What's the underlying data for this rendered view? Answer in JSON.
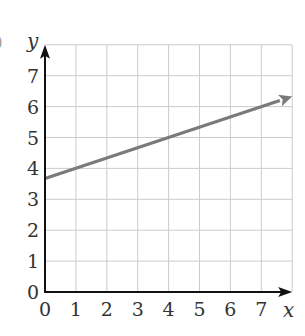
{
  "chart_data": {
    "type": "line",
    "title": "",
    "xlabel": "x",
    "ylabel": "y",
    "xlim": [
      0,
      8
    ],
    "ylim": [
      0,
      8
    ],
    "x_ticks": [
      "0",
      "1",
      "2",
      "3",
      "4",
      "5",
      "6",
      "7"
    ],
    "y_ticks": [
      "0",
      "1",
      "2",
      "3",
      "4",
      "5",
      "6",
      "7"
    ],
    "grid": true,
    "legend": null,
    "series": [
      {
        "name": "line",
        "equation": "y = x/3 + 11/3",
        "x": [
          0,
          8
        ],
        "y": [
          3.67,
          6.33
        ],
        "arrow_at_end": true,
        "color": "#7a7a7a"
      }
    ]
  },
  "colors": {
    "grid": "#cccccc",
    "axes": "#111111",
    "line": "#7a7a7a",
    "text": "#333333"
  },
  "fragment_left_edge": ")"
}
